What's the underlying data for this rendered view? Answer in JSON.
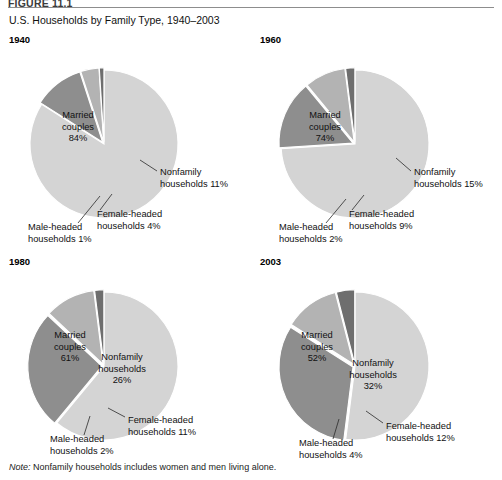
{
  "figure": {
    "label": "FIGURE 11.1",
    "title": "U.S. Households by Family Type, 1940–2003",
    "note_prefix": "Note:",
    "note_text": " Nonfamily households includes women and men living alone."
  },
  "colors": {
    "married": "#d4d4d4",
    "nonfamily": "#8e8e8e",
    "female": "#b3b3b3",
    "male": "#6e6e6e",
    "background": "#ffffff",
    "separator": "#ffffff",
    "text": "#111111",
    "rule": "#8d8d8d"
  },
  "chart_data": [
    {
      "type": "pie",
      "title": "1940",
      "categories": [
        "Married couples",
        "Nonfamily households",
        "Female-headed households",
        "Male-headed households"
      ],
      "values": [
        84,
        11,
        4,
        1
      ],
      "labels": [
        "84%",
        "11%",
        "4%",
        "1%"
      ],
      "inside_labels": [
        {
          "line1": "Married",
          "line2": "couples",
          "line3": "84%"
        }
      ],
      "callouts": [
        {
          "name": "nonfamily",
          "line1": "Nonfamily",
          "line2": "households 11%"
        },
        {
          "name": "female-headed",
          "line1": "Female-headed",
          "line2": "households 4%"
        },
        {
          "name": "male-headed",
          "line1": "Male-headed",
          "line2": "households 1%"
        }
      ]
    },
    {
      "type": "pie",
      "title": "1960",
      "categories": [
        "Married couples",
        "Nonfamily households",
        "Female-headed households",
        "Male-headed households"
      ],
      "values": [
        74,
        15,
        9,
        2
      ],
      "labels": [
        "74%",
        "15%",
        "9%",
        "2%"
      ],
      "inside_labels": [
        {
          "line1": "Married",
          "line2": "couples",
          "line3": "74%"
        }
      ],
      "callouts": [
        {
          "name": "nonfamily",
          "line1": "Nonfamily",
          "line2": "households 15%"
        },
        {
          "name": "female-headed",
          "line1": "Female-headed",
          "line2": "households 9%"
        },
        {
          "name": "male-headed",
          "line1": "Male-headed",
          "line2": "households 2%"
        }
      ]
    },
    {
      "type": "pie",
      "title": "1980",
      "categories": [
        "Married couples",
        "Nonfamily households",
        "Female-headed households",
        "Male-headed households"
      ],
      "values": [
        61,
        26,
        11,
        2
      ],
      "labels": [
        "61%",
        "26%",
        "11%",
        "2%"
      ],
      "inside_labels": [
        {
          "line1": "Married",
          "line2": "couples",
          "line3": "61%"
        },
        {
          "line1": "Nonfamily",
          "line2": "households",
          "line3": "26%"
        }
      ],
      "callouts": [
        {
          "name": "female-headed",
          "line1": "Female-headed",
          "line2": "households 11%"
        },
        {
          "name": "male-headed",
          "line1": "Male-headed",
          "line2": "households 2%"
        }
      ]
    },
    {
      "type": "pie",
      "title": "2003",
      "categories": [
        "Married couples",
        "Nonfamily households",
        "Female-headed households",
        "Male-headed households"
      ],
      "values": [
        52,
        32,
        12,
        4
      ],
      "labels": [
        "52%",
        "32%",
        "12%",
        "4%"
      ],
      "inside_labels": [
        {
          "line1": "Married",
          "line2": "couples",
          "line3": "52%"
        },
        {
          "line1": "Nonfamily",
          "line2": "households",
          "line3": "32%"
        }
      ],
      "callouts": [
        {
          "name": "female-headed",
          "line1": "Female-headed",
          "line2": "households 12%"
        },
        {
          "name": "male-headed",
          "line1": "Male-headed",
          "line2": "households 4%"
        }
      ]
    }
  ],
  "layout": {
    "panels": [
      {
        "index": 0,
        "left": 0,
        "top": 34,
        "cx": 104,
        "cy": 110,
        "r": 74
      },
      {
        "index": 1,
        "left": 251,
        "top": 34,
        "cx": 104,
        "cy": 110,
        "r": 74
      },
      {
        "index": 2,
        "left": 0,
        "top": 256,
        "cx": 104,
        "cy": 110,
        "r": 74
      },
      {
        "index": 3,
        "left": 251,
        "top": 256,
        "cx": 104,
        "cy": 110,
        "r": 74
      }
    ]
  }
}
